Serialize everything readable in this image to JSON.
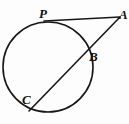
{
  "figure": {
    "type": "geometry-diagram",
    "background_color": "#fdfdfd",
    "stroke_color": "#171717",
    "labels": {
      "P": "P",
      "A": "A",
      "B": "B",
      "C": "C"
    },
    "circle": {
      "center_x": 48,
      "center_y": 67,
      "radius": 45,
      "stroke_width": 1.6
    },
    "tangent_line": {
      "name": "PA",
      "from_x": 44,
      "from_y": 21,
      "to_x": 120,
      "to_y": 17,
      "stroke_width": 1.6
    },
    "secant_line": {
      "name": "AC",
      "from_x": 120,
      "from_y": 17,
      "to_x": 29,
      "to_y": 111,
      "stroke_width": 1.6
    },
    "points": [
      {
        "name": "P",
        "x": 46,
        "y": 21,
        "on": "circle-tangency"
      },
      {
        "name": "A",
        "x": 120,
        "y": 17,
        "on": "external-vertex"
      },
      {
        "name": "B",
        "x": 87,
        "y": 52,
        "on": "circle-secant-near"
      },
      {
        "name": "C",
        "x": 33,
        "y": 104,
        "on": "circle-secant-far"
      }
    ]
  }
}
